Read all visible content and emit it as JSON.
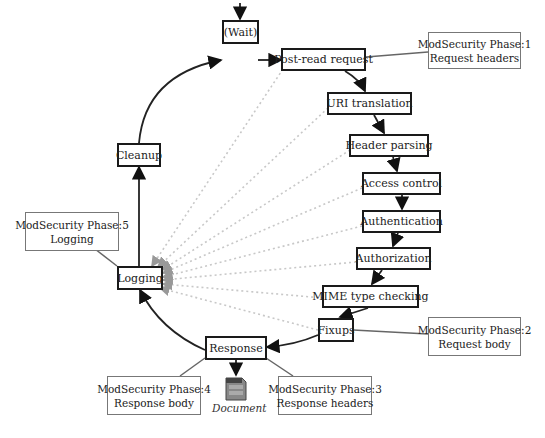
{
  "diagram": {
    "type": "flowchart",
    "nodes": {
      "wait": "(Wait)",
      "post_read": "Post-read request",
      "uri_translation": "URI translation",
      "header_parsing": "Header parsing",
      "access_control": "Access control",
      "authentication": "Authentication",
      "authorization": "Authorization",
      "mime": "MIME type checking",
      "fixups": "Fixups",
      "response": "Response",
      "logging": "Logging",
      "cleanup": "Cleanup"
    },
    "phases": {
      "p1": {
        "line1": "ModSecurity Phase:1",
        "line2": "Request headers"
      },
      "p2": {
        "line1": "ModSecurity Phase:2",
        "line2": "Request body"
      },
      "p3": {
        "line1": "ModSecurity Phase:3",
        "line2": "Response headers"
      },
      "p4": {
        "line1": "ModSecurity Phase:4",
        "line2": "Response body"
      },
      "p5": {
        "line1": "ModSecurity Phase:5",
        "line2": "Logging"
      }
    },
    "document_label": "Document",
    "edges": [
      [
        "start",
        "wait"
      ],
      [
        "wait",
        "post_read"
      ],
      [
        "post_read",
        "uri_translation"
      ],
      [
        "uri_translation",
        "header_parsing"
      ],
      [
        "header_parsing",
        "access_control"
      ],
      [
        "access_control",
        "authentication"
      ],
      [
        "authentication",
        "authorization"
      ],
      [
        "authorization",
        "mime"
      ],
      [
        "mime",
        "fixups"
      ],
      [
        "fixups",
        "response"
      ],
      [
        "response",
        "document"
      ],
      [
        "response",
        "logging"
      ],
      [
        "logging",
        "cleanup"
      ],
      [
        "cleanup",
        "wait"
      ]
    ],
    "dotted_edges_to_logging_from": [
      "post_read",
      "uri_translation",
      "header_parsing",
      "access_control",
      "authentication",
      "authorization",
      "mime",
      "fixups"
    ],
    "colors": {
      "node_border": "#1a1a1a",
      "phase_border": "#777777",
      "dotted": "#c8c8c8",
      "document": "#666666"
    }
  }
}
